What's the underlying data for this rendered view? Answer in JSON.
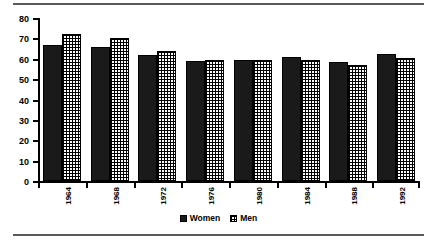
{
  "chart_data": {
    "type": "bar",
    "title": "",
    "xlabel": "",
    "ylabel": "",
    "categories": [
      "1964",
      "1968",
      "1972",
      "1976",
      "1980",
      "1984",
      "1988",
      "1992"
    ],
    "series": [
      {
        "name": "Women",
        "values": [
          67,
          66,
          62,
          59,
          59.5,
          61,
          58.5,
          62.5
        ],
        "color": "#1a1a1a",
        "pattern": "solid"
      },
      {
        "name": "Men",
        "values": [
          72,
          70,
          64,
          59.5,
          59.5,
          59.5,
          57,
          60.5
        ],
        "color": "#000000",
        "pattern": "grid"
      }
    ],
    "ylim": [
      0,
      80
    ],
    "yticks": [
      0,
      10,
      20,
      30,
      40,
      50,
      60,
      70,
      80
    ],
    "ytick_labels": [
      "0",
      "10",
      "20",
      "30",
      "40",
      "50",
      "60",
      "70",
      "80"
    ],
    "grid": false,
    "legend": {
      "position": "bottom-center",
      "entries": [
        {
          "label": "Women",
          "pattern": "solid"
        },
        {
          "label": "Men",
          "pattern": "grid"
        }
      ]
    },
    "xtick_rotation": 90
  }
}
